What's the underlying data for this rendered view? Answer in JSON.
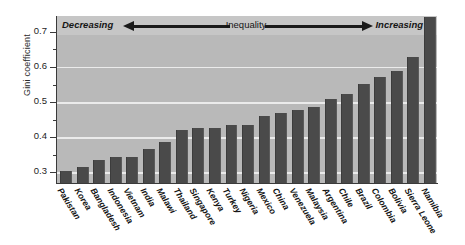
{
  "chart_data": {
    "type": "bar",
    "title": "",
    "xlabel": "",
    "ylabel": "Gini coefficient",
    "ylim": [
      0.27,
      0.745
    ],
    "ytick_major": [
      "0.3",
      "0.4",
      "0.5",
      "0.6",
      "0.7"
    ],
    "ytick_major_values": [
      0.3,
      0.4,
      0.5,
      0.6,
      0.7
    ],
    "ytick_minor_values": [
      0.35,
      0.45,
      0.55,
      0.65
    ],
    "grid": "horizontal-major",
    "legend": "none",
    "bar_color": "#4a4a4a",
    "plot_background": "#b9b9b9",
    "gridline_color": "#efefef",
    "categories": [
      "Pakistan",
      "Korea",
      "Bangladesh",
      "Indonesia",
      "Vietnam",
      "India",
      "Malawi",
      "Thailand",
      "Singapore",
      "Kenya",
      "Turkey",
      "Nigeria",
      "Mexico",
      "China",
      "Venezuela",
      "Malaysia",
      "Argentina",
      "Chile",
      "Brazil",
      "Colombia",
      "Bolivia",
      "Sierra Leone",
      "Namibia"
    ],
    "values": [
      0.305,
      0.316,
      0.336,
      0.343,
      0.344,
      0.366,
      0.388,
      0.421,
      0.426,
      0.426,
      0.434,
      0.435,
      0.462,
      0.469,
      0.477,
      0.486,
      0.509,
      0.522,
      0.551,
      0.572,
      0.588,
      0.628,
      0.743
    ],
    "annotations": {
      "left_label": "Decreasing",
      "center_label": "Inequality",
      "right_label": "Increasing",
      "left_arrow": "arrow-pointing-left",
      "right_arrow": "arrow-pointing-right"
    }
  }
}
